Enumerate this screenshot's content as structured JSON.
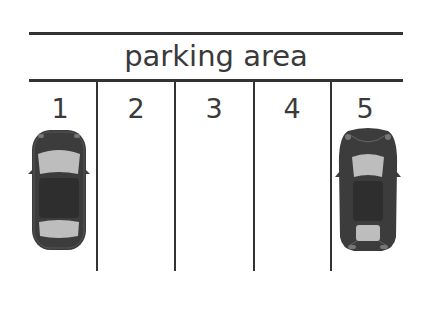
{
  "diagram": {
    "title": "parking area",
    "spaces": [
      {
        "number": "1",
        "occupied": true,
        "car": "sedan"
      },
      {
        "number": "2",
        "occupied": false
      },
      {
        "number": "3",
        "occupied": false
      },
      {
        "number": "4",
        "occupied": false
      },
      {
        "number": "5",
        "occupied": true,
        "car": "sports car"
      }
    ],
    "colors": {
      "line": "#333333",
      "car_body": "#3c3c3c",
      "car_glass": "#bdbdbd",
      "text": "#3a3a3a"
    }
  }
}
